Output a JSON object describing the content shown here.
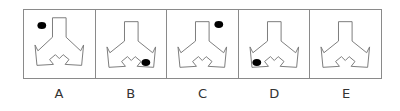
{
  "puzzle": {
    "panels": [
      {
        "label": "A",
        "orientation": "stem-down",
        "dot": "top-left"
      },
      {
        "label": "B",
        "orientation": "stem-up",
        "dot": "bottom-right"
      },
      {
        "label": "C",
        "orientation": "stem-up",
        "dot": "top-right"
      },
      {
        "label": "D",
        "orientation": "stem-up",
        "dot": "bottom-left"
      },
      {
        "label": "E",
        "orientation": "stem-up",
        "dot": "none"
      }
    ],
    "colors": {
      "line": "#7a7a7a",
      "dot": "#000000",
      "frame": "#8a8a8a"
    }
  }
}
